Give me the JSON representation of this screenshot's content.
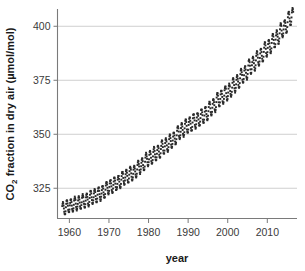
{
  "chart_data": {
    "type": "scatter",
    "title": "",
    "subtitle": "",
    "xlabel": "year",
    "ylabel": "CO2 fraction in dry air (µmol/mol)",
    "ylabel_parts": {
      "prefix": "CO",
      "sub": "2",
      "suffix": " fraction in dry air (µmol/mol)"
    },
    "xlim": [
      1957.0,
      2017.5
    ],
    "ylim": [
      311.0,
      408.0
    ],
    "xticks": [
      1960,
      1970,
      1980,
      1990,
      2000,
      2010
    ],
    "xtick_labels": [
      "1960",
      "1970",
      "1980",
      "1990",
      "2000",
      "2010"
    ],
    "yticks": [
      325,
      350,
      375,
      400
    ],
    "ytick_labels": [
      "325",
      "350",
      "375",
      "400"
    ],
    "grid": "horizontal",
    "legend": "none",
    "marker": "small-filled-square",
    "marker_color": "#2a2a2a",
    "marker_size_px": 1.9,
    "gridline_color": "#c9c9c9",
    "axis_color": "#7a7a7a",
    "annotations": [],
    "series": [
      {
        "name": "Monthly mean CO2",
        "trend_anchors": [
          {
            "x": 1958.2,
            "y": 315.3
          },
          {
            "x": 1960.0,
            "y": 316.9
          },
          {
            "x": 1962.0,
            "y": 318.0
          },
          {
            "x": 1964.0,
            "y": 319.2
          },
          {
            "x": 1966.0,
            "y": 321.1
          },
          {
            "x": 1968.0,
            "y": 322.6
          },
          {
            "x": 1970.0,
            "y": 325.5
          },
          {
            "x": 1972.0,
            "y": 327.3
          },
          {
            "x": 1974.0,
            "y": 330.1
          },
          {
            "x": 1976.0,
            "y": 331.9
          },
          {
            "x": 1978.0,
            "y": 335.2
          },
          {
            "x": 1980.0,
            "y": 338.6
          },
          {
            "x": 1982.0,
            "y": 341.1
          },
          {
            "x": 1984.0,
            "y": 344.3
          },
          {
            "x": 1986.0,
            "y": 347.1
          },
          {
            "x": 1988.0,
            "y": 351.3
          },
          {
            "x": 1990.0,
            "y": 354.2
          },
          {
            "x": 1992.0,
            "y": 356.3
          },
          {
            "x": 1994.0,
            "y": 358.7
          },
          {
            "x": 1996.0,
            "y": 362.4
          },
          {
            "x": 1998.0,
            "y": 366.5
          },
          {
            "x": 2000.0,
            "y": 369.4
          },
          {
            "x": 2002.0,
            "y": 373.2
          },
          {
            "x": 2004.0,
            "y": 377.5
          },
          {
            "x": 2006.0,
            "y": 381.8
          },
          {
            "x": 2008.0,
            "y": 385.6
          },
          {
            "x": 2010.0,
            "y": 389.8
          },
          {
            "x": 2012.0,
            "y": 393.8
          },
          {
            "x": 2014.0,
            "y": 398.6
          },
          {
            "x": 2016.0,
            "y": 404.2
          },
          {
            "x": 2016.6,
            "y": 404.8
          }
        ],
        "seasonal_amplitude": 3.1,
        "seasonal_peak_month_fraction": 0.37,
        "n_points": 702,
        "units": "µmol/mol"
      }
    ]
  },
  "axes": {
    "x_title": "year",
    "y_title_prefix": "CO",
    "y_title_sub": "2",
    "y_title_suffix": " fraction in dry air (µmol/mol)"
  }
}
